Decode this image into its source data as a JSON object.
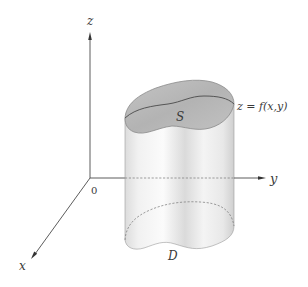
{
  "figure": {
    "axes": {
      "z_label": "z",
      "y_label": "y",
      "x_label": "x",
      "origin_label": "0"
    },
    "surface_label": "S",
    "surface_equation": "z = f(x,y)",
    "region_label": "D",
    "colors": {
      "axis": "#4a4a4a",
      "cap_fill": "#b9b9b9",
      "cap_edge": "#7a7a7a",
      "cap_ridge": "#555555",
      "dashed": "#777777"
    }
  }
}
